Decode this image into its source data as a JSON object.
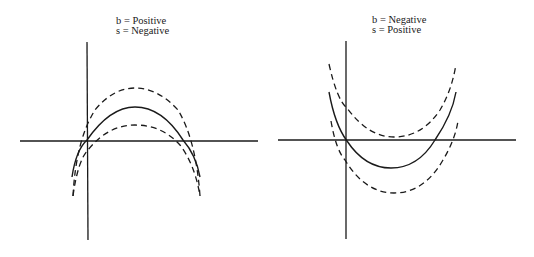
{
  "panels": [
    {
      "label_line1": "b = Positive",
      "label_line2": "s = Negative",
      "curve_shape": "concave-down parabola"
    },
    {
      "label_line1": "b = Negative",
      "label_line2": "s = Positive",
      "curve_shape": "concave-up parabola"
    }
  ],
  "colors": {
    "stroke": "#1a1a1a",
    "background": "#ffffff"
  },
  "legend": {
    "solid": "fitted curve",
    "dashed": "confidence bands"
  }
}
